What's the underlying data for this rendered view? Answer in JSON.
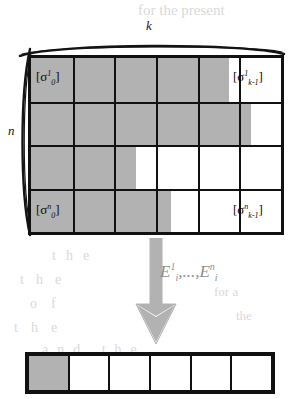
{
  "figure": {
    "axis_labels": {
      "columns": "k",
      "rows": "n"
    },
    "matrix": {
      "rows": 4,
      "columns": 6,
      "fill_color": "#b2b2b2",
      "empty_color": "#ffffff",
      "border_color": "#111111",
      "row_fill_fraction": [
        0.79,
        0.88,
        0.42,
        0.56
      ],
      "corner_labels": {
        "top_left": {
          "bracket_open": "[",
          "symbol": "σ",
          "superscript": "1",
          "subscript": "0",
          "bracket_close": "]"
        },
        "top_right": {
          "bracket_open": "[",
          "symbol": "σ",
          "superscript": "1",
          "subscript": "k-1",
          "bracket_close": "]"
        },
        "bottom_left": {
          "bracket_open": "[",
          "symbol": "σ",
          "superscript": "n",
          "subscript": "0",
          "bracket_close": "]"
        },
        "bottom_right": {
          "bracket_open": "[",
          "symbol": "σ",
          "superscript": "n",
          "subscript": "k-1",
          "bracket_close": "]"
        }
      }
    },
    "arrow": {
      "direction": "down",
      "color": "#b2b2b2",
      "label": {
        "first_symbol": "E",
        "first_superscript": "1",
        "first_subscript": "i",
        "ellipsis": ",...,",
        "second_symbol": "E",
        "second_superscript": "n",
        "second_subscript": "i"
      }
    },
    "result_strip": {
      "cells": 6,
      "shaded_cells": 1,
      "fill_color": "#b2b2b2",
      "empty_color": "#ffffff",
      "border_color": "#111111"
    }
  },
  "page_bleed": {
    "line1": "for the present",
    "line2": "the",
    "line3": "the",
    "line4": "of",
    "line5": "the",
    "line6": "and the",
    "line7": "later the",
    "line8": "for a",
    "line9": "the",
    "line10": "that"
  }
}
